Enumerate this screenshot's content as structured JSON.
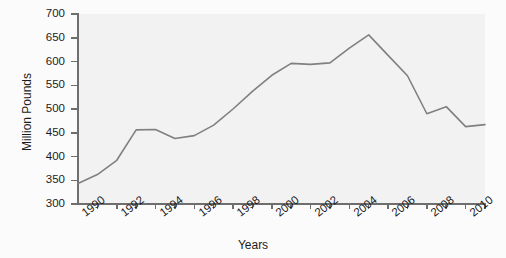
{
  "chart_data": {
    "type": "line",
    "title": "",
    "xlabel": "Years",
    "ylabel": "Million Pounds",
    "xlim": [
      1989,
      2010
    ],
    "ylim": [
      300,
      700
    ],
    "grid": false,
    "legend": false,
    "line_color": "#808080",
    "background_color": "#f2f2f2",
    "axis_color": "#6e6e6e",
    "x": [
      1989,
      1990,
      1991,
      1992,
      1993,
      1994,
      1995,
      1996,
      1997,
      1998,
      1999,
      2000,
      2001,
      2002,
      2003,
      2004,
      2005,
      2006,
      2007,
      2008,
      2009,
      2010
    ],
    "values": [
      343,
      362,
      392,
      456,
      457,
      438,
      444,
      466,
      500,
      537,
      571,
      596,
      594,
      597,
      628,
      656,
      613,
      570,
      490,
      505,
      463,
      467
    ],
    "series": [
      {
        "name": "Million Pounds",
        "values": [
          343,
          362,
          392,
          456,
          457,
          438,
          444,
          466,
          500,
          537,
          571,
          596,
          594,
          597,
          628,
          656,
          613,
          570,
          490,
          505,
          463,
          467
        ]
      }
    ],
    "ytick_labels": [
      "300",
      "350",
      "400",
      "450",
      "500",
      "550",
      "600",
      "650",
      "700"
    ],
    "ytick_values": [
      300,
      350,
      400,
      450,
      500,
      550,
      600,
      650,
      700
    ],
    "xtick_labels": [
      "1990",
      "1992",
      "1994",
      "1996",
      "1998",
      "2000",
      "2002",
      "2004",
      "2006",
      "2008",
      "2010"
    ],
    "xtick_values": [
      1990,
      1992,
      1994,
      1996,
      1998,
      2000,
      2002,
      2004,
      2006,
      2008,
      2010
    ]
  }
}
